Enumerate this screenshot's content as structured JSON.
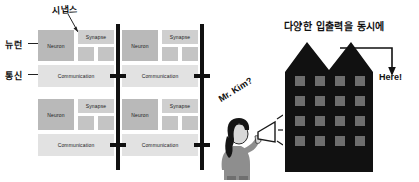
{
  "figure": {
    "left_diagram": {
      "annotations": {
        "neuron_label": "뉴런",
        "communication_label": "통신",
        "synapse_label": "시냅스"
      },
      "block_labels": {
        "neuron": "Neuron",
        "synapse": "Synapse",
        "communication": "Communication"
      },
      "grid": {
        "rows": 2,
        "cols": 2,
        "tiles": 4
      },
      "tiles": [
        {
          "neuron": "Neuron",
          "synapse": "Synapse",
          "communication": "Communication"
        },
        {
          "neuron": "Neuron",
          "synapse": "Synapse",
          "communication": "Communication"
        },
        {
          "neuron": "Neuron",
          "synapse": "Synapse",
          "communication": "Communication"
        },
        {
          "neuron": "Neuron",
          "synapse": "Synapse",
          "communication": "Communication"
        }
      ],
      "colors": {
        "neuron_block": "#b9b9b9",
        "synapse_block": "#cfcfcf",
        "small_block": "#c4c4c4",
        "communication_block": "#e2e2e2",
        "bus": "#111111"
      }
    },
    "right_illustration": {
      "title": "다양한 입출력을 동시에",
      "here_label": "Here!",
      "speech_label": "Mr. Kim?",
      "building": {
        "window_rows": 4,
        "window_cols": 4,
        "window_count": 16,
        "roof_peaks": 2,
        "body_color": "#111111",
        "window_color": "#6e6e6e"
      }
    }
  }
}
